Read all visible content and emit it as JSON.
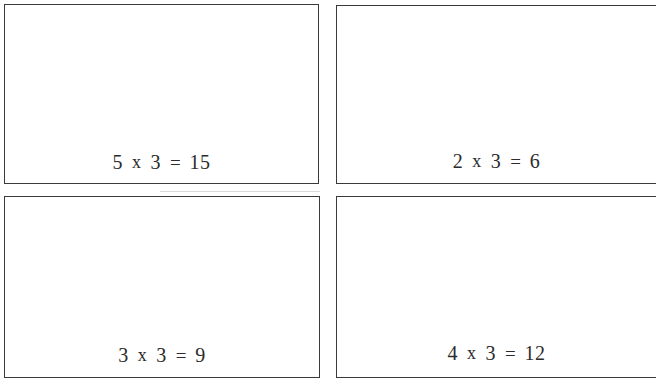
{
  "page": {
    "background_color": "#ffffff",
    "border_color": "#3a3a3a",
    "text_color": "#2b2b2b"
  },
  "cards": [
    {
      "position": "top-left",
      "equation_text": "5 x 3 = 15",
      "multiplicand": "5",
      "operator": "x",
      "multiplier": "3",
      "equals": "=",
      "product": "15"
    },
    {
      "position": "top-right",
      "equation_text": "2 x 3 = 6",
      "multiplicand": "2",
      "operator": "x",
      "multiplier": "3",
      "equals": "=",
      "product": "6"
    },
    {
      "position": "bottom-left",
      "equation_text": "3 x 3 = 9",
      "multiplicand": "3",
      "operator": "x",
      "multiplier": "3",
      "equals": "=",
      "product": "9"
    },
    {
      "position": "bottom-right",
      "equation_text": "4 x 3 = 12",
      "multiplicand": "4",
      "operator": "x",
      "multiplier": "3",
      "equals": "=",
      "product": "12"
    }
  ]
}
